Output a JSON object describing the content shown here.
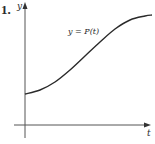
{
  "problem": {
    "number": "1."
  },
  "chart_data": {
    "type": "line",
    "title": "",
    "xlabel": "t",
    "ylabel": "y",
    "series": [
      {
        "name": "y = P(t)",
        "description": "Sigmoid/logistic-shaped increasing curve starting at a positive y-intercept and leveling off",
        "points_px": [
          [
            25,
            94
          ],
          [
            40,
            90
          ],
          [
            55,
            82
          ],
          [
            70,
            70
          ],
          [
            85,
            56
          ],
          [
            100,
            42
          ],
          [
            115,
            29
          ],
          [
            130,
            20
          ],
          [
            145,
            16
          ],
          [
            152,
            15
          ]
        ]
      }
    ],
    "annotations": [
      {
        "text": "y = P(t)",
        "position": "above curve, middle"
      }
    ],
    "grid": false,
    "ticks": "none",
    "legend": "none"
  },
  "labels": {
    "y_axis": "y",
    "x_axis": "t",
    "curve": "y = P(t)"
  },
  "colors": {
    "axis": "#555555",
    "curve": "#2a2a2a",
    "text": "#2a2a2a"
  }
}
